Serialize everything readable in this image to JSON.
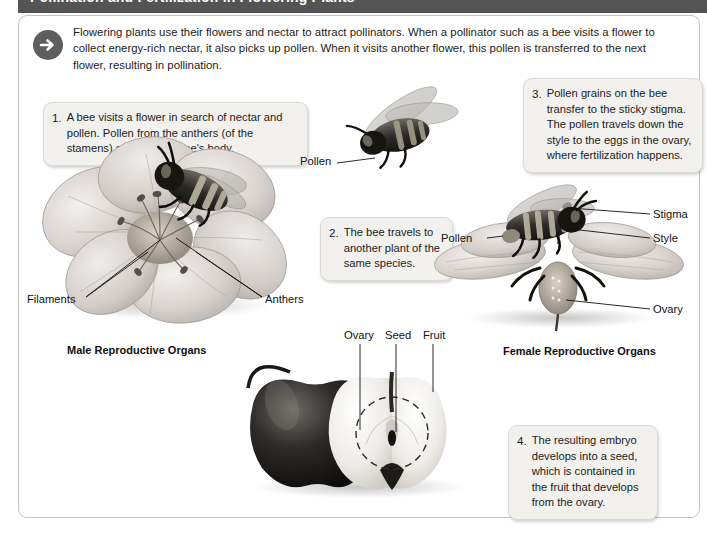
{
  "header": {
    "title": "Pollination and Fertilization in Flowering Plants"
  },
  "intro": {
    "icon": "arrow-right-circle-icon",
    "text": "Flowering plants use their flowers and nectar to attract pollinators. When a pollinator such as a bee visits a flower to collect energy-rich nectar, it also picks up pollen. When it visits another flower, this pollen is transferred to the next flower, resulting in pollination."
  },
  "steps": [
    {
      "number": "1.",
      "text": "A bee visits a flower in search of nectar and pollen. Pollen from the anthers (of the stamens) sticks to the bee's body."
    },
    {
      "number": "2.",
      "text": "The bee travels to another plant of the same species."
    },
    {
      "number": "3.",
      "text": "Pollen grains on the bee transfer to the sticky stigma. The pollen travels down the style to the eggs in the ovary, where fertilization happens."
    },
    {
      "number": "4.",
      "text": "The resulting embryo develops into a seed, which is contained in the fruit that develops from the ovary."
    }
  ],
  "captions": {
    "male": "Male Reproductive Organs",
    "female": "Female Reproductive Organs"
  },
  "labels": {
    "filaments": "Filaments",
    "anthers": "Anthers",
    "pollen_flying_bee": "Pollen",
    "pollen_female_flower": "Pollen",
    "stigma": "Stigma",
    "style": "Style",
    "ovary_flower": "Ovary",
    "ovary_apple": "Ovary",
    "seed": "Seed",
    "fruit": "Fruit"
  },
  "figures": {
    "male_flower_with_bee": "flower-with-bee-illustration",
    "flying_bee": "flying-bee-illustration",
    "female_flower_with_bee": "female-flower-with-bee-illustration",
    "apples": "whole-and-halved-apple-illustration",
    "ovary_highlight": "dashed-circle-ovary-marker"
  },
  "colors": {
    "header_bar": "#545454",
    "callout_fill": "#f2f1ee",
    "callout_border": "#dcdad5",
    "frame_border": "#c3c3c3",
    "icon_circle": "#5e5e5e",
    "text": "#1c1c1c"
  }
}
